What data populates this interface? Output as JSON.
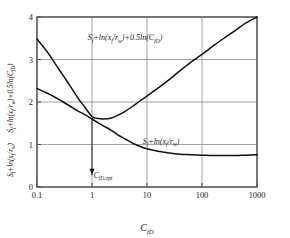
{
  "chart_data": {
    "type": "line",
    "title": "",
    "xlabel": "C_fD",
    "xlabel_parts": {
      "base": "C",
      "sub": "fD"
    },
    "ylabel_upper_parts": {
      "text": "S_f+ln(x_f/r_w)+0.5ln(C_fD)"
    },
    "ylabel_lower_parts": {
      "text": "S_f+ln(x_f/r_w)"
    },
    "xscale": "log",
    "yscale": "linear",
    "xlim": [
      0.1,
      1000
    ],
    "ylim": [
      0,
      4
    ],
    "xticks": [
      "0.1",
      "1",
      "10",
      "100",
      "1000"
    ],
    "xtick_values": [
      0.1,
      1,
      10,
      100,
      1000
    ],
    "yticks": [
      "0",
      "1",
      "2",
      "3",
      "4"
    ],
    "ytick_values": [
      0,
      1,
      2,
      3,
      4
    ],
    "grid": "on",
    "gridlines_x": [
      1,
      10,
      100
    ],
    "gridlines_y": [
      1,
      2,
      3
    ],
    "legend_position": "inline-annotation",
    "series": [
      {
        "name": "S_f+ln(x_f/r_w)+0.5ln(C_fD)",
        "label": "Sƒ+ln(xƒ/rᵥᵥ)+0.5ln(Cƒᴅ)",
        "color": "#111111",
        "x": [
          0.1,
          0.13,
          0.17,
          0.22,
          0.3,
          0.4,
          0.55,
          0.7,
          1.0,
          1.3,
          1.6,
          2.2,
          3.0,
          4.0,
          5.5,
          7.0,
          10,
          16,
          25,
          40,
          63,
          100,
          160,
          250,
          400,
          630,
          1000
        ],
        "y": [
          3.48,
          3.3,
          3.1,
          2.88,
          2.62,
          2.38,
          2.1,
          1.92,
          1.66,
          1.61,
          1.6,
          1.62,
          1.69,
          1.78,
          1.9,
          2.0,
          2.14,
          2.33,
          2.52,
          2.74,
          2.94,
          3.12,
          3.32,
          3.5,
          3.68,
          3.86,
          4.0
        ],
        "annotation": {
          "text": "Sƒ+ln(xƒ/rᵥᵥ)+0.5ln(Cƒᴅ)",
          "x": 4.0,
          "y": 3.45
        }
      },
      {
        "name": "S_f+ln(x_f/r_w)",
        "label": "Sƒ+ln(xƒ/rᵥᵥ)",
        "color": "#111111",
        "x": [
          0.1,
          0.13,
          0.17,
          0.22,
          0.3,
          0.4,
          0.55,
          0.7,
          1.0,
          1.3,
          1.6,
          2.2,
          3.0,
          4.0,
          5.5,
          7.0,
          10,
          16,
          25,
          40,
          63,
          100,
          160,
          250,
          400,
          630,
          1000
        ],
        "y": [
          2.32,
          2.25,
          2.18,
          2.1,
          2.0,
          1.9,
          1.79,
          1.72,
          1.6,
          1.51,
          1.44,
          1.34,
          1.22,
          1.13,
          1.03,
          0.97,
          0.9,
          0.84,
          0.8,
          0.77,
          0.76,
          0.75,
          0.74,
          0.74,
          0.74,
          0.75,
          0.76
        ],
        "annotation": {
          "text": "Sƒ+ln(xƒ/rᵥᵥ)",
          "x": 18,
          "y": 1.02
        }
      }
    ],
    "annotations": [
      {
        "name": "optimum-marker",
        "type": "arrow",
        "label": "C_fD,opt",
        "label_parts": {
          "base": "C",
          "sub": "fD,opt"
        },
        "x": 1.0,
        "y_from": 1.62,
        "y_to": 0.3,
        "label_y": 0.22
      }
    ]
  },
  "axis": {
    "x_title": "C",
    "x_title_sub": "fD",
    "y_title_upper_main": "S",
    "y_title_upper_sub1": "f",
    "y_title_upper_rest": "+ln(x",
    "y_title_upper_sub2": "f",
    "y_title_upper_rest2": "/r",
    "y_title_upper_sub3": "w",
    "y_title_upper_rest3": ")+0.5ln(C",
    "y_title_upper_sub4": "fD",
    "y_title_upper_rest4": ")",
    "y_title_lower_main": "S",
    "y_title_lower_sub1": "f",
    "y_title_lower_rest": "+ln(x",
    "y_title_lower_sub2": "f",
    "y_title_lower_rest2": "/r",
    "y_title_lower_sub3": "w",
    "y_title_lower_rest3": ")"
  },
  "curve_labels": {
    "upper_main": "S",
    "upper_sub1": "f",
    "upper_p1": "+ln(x",
    "upper_sub2": "f",
    "upper_p2": "/r",
    "upper_sub3": "w",
    "upper_p3": ")+0.5ln(C",
    "upper_sub4": "fD",
    "upper_p4": ")",
    "lower_main": "S",
    "lower_sub1": "f",
    "lower_p1": "+ln(x",
    "lower_sub2": "f",
    "lower_p2": "/r",
    "lower_sub3": "w",
    "lower_p3": ")"
  },
  "optimum": {
    "main": "C",
    "sub": "fD,opt"
  },
  "colors": {
    "curve": "#111111",
    "grid": "#8c8c8c",
    "axis": "#555555",
    "text": "#1a1a1a",
    "background": "#ffffff"
  }
}
